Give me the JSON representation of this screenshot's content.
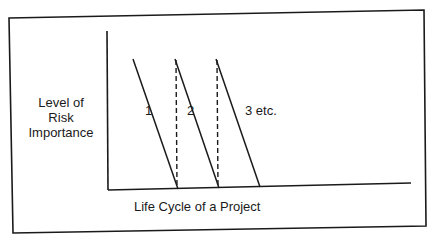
{
  "diagram": {
    "y_axis_label": [
      "Level of",
      "Risk",
      "Importance"
    ],
    "x_axis_label": "Life Cycle of a Project",
    "curves": [
      {
        "label": "1"
      },
      {
        "label": "2"
      },
      {
        "label": "3 etc."
      }
    ],
    "colors": {
      "line": "#1a1a1a",
      "background": "#ffffff"
    }
  }
}
